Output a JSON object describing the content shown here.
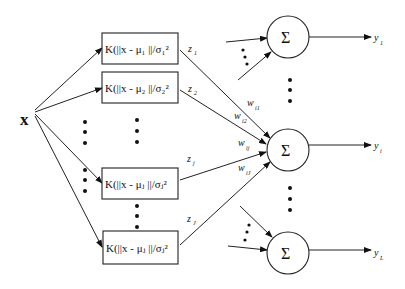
{
  "diagram": {
    "input": {
      "label": "x"
    },
    "kernel_units": [
      {
        "label": "K(||x - μ₁ ||/σ₁²",
        "output": "z",
        "output_sub": "1"
      },
      {
        "label": "K(||x - μ₂ ||/σ₂²",
        "output": "z",
        "output_sub": "2"
      },
      {
        "label": "K(||x - μⱼ ||/σⱼ²",
        "output": "z",
        "output_sub": "j"
      },
      {
        "label": "K(||x - μⱼ ||/σⱼ²",
        "output": "z",
        "output_sub": "J"
      }
    ],
    "summation_units": [
      {
        "symbol": "Σ",
        "output": "y",
        "output_sub": "1"
      },
      {
        "symbol": "Σ",
        "output": "y",
        "output_sub": "i"
      },
      {
        "symbol": "Σ",
        "output": "y",
        "output_sub": "L"
      }
    ],
    "weights": [
      {
        "label": "w",
        "sub": "i1"
      },
      {
        "label": "w",
        "sub": "i2"
      },
      {
        "label": "w",
        "sub": "ij"
      },
      {
        "label": "w",
        "sub": "iJ"
      }
    ],
    "ellipsis": "⋮"
  }
}
